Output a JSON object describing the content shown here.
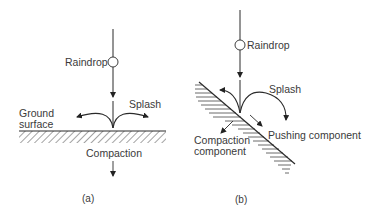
{
  "panel_a": {
    "raindrop_label": "Raindrop",
    "splash_label": "Splash",
    "ground_label_line1": "Ground",
    "ground_label_line2": "surface",
    "compaction_label": "Compaction",
    "caption": "(a)"
  },
  "panel_b": {
    "raindrop_label": "Raindrop",
    "splash_label": "Splash",
    "pushing_label": "Pushing component",
    "compaction_label_line1": "Compaction",
    "compaction_label_line2": "component",
    "caption": "(b)"
  },
  "colors": {
    "line": "#2a2a2a",
    "text": "#3a3a3a",
    "background": "#ffffff"
  }
}
